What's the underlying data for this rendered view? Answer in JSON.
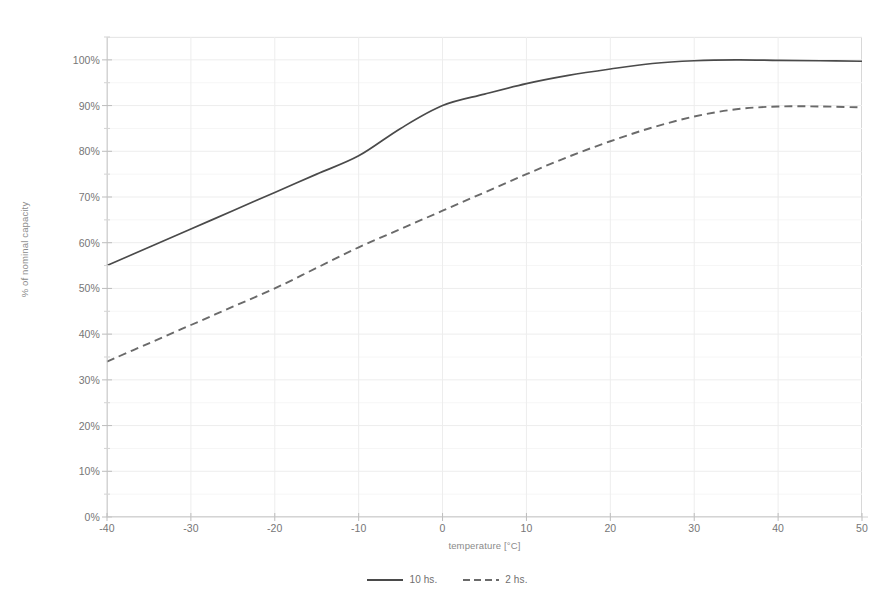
{
  "chart_data": {
    "type": "line",
    "title": "",
    "subtitle": "",
    "xlabel": "temperature [°C]",
    "ylabel": "% of nominal capacity",
    "xlim": [
      -40,
      50
    ],
    "ylim": [
      0,
      105
    ],
    "x_ticks": [
      -40,
      -30,
      -20,
      -10,
      0,
      10,
      20,
      30,
      40,
      50
    ],
    "x_tick_labels": [
      "-40",
      "-30",
      "-20",
      "-10",
      "0",
      "10",
      "20",
      "30",
      "40",
      "50"
    ],
    "y_ticks": [
      0,
      10,
      20,
      30,
      40,
      50,
      60,
      70,
      80,
      90,
      100
    ],
    "y_tick_labels": [
      "0%",
      "10%",
      "20%",
      "30%",
      "40%",
      "50%",
      "60%",
      "70%",
      "80%",
      "90%",
      "100%"
    ],
    "y_minor_ticks": [
      5,
      15,
      25,
      35,
      45,
      55,
      65,
      75,
      85,
      95,
      105
    ],
    "grid": true,
    "grid_color": "#ededed",
    "legend_position": "bottom",
    "plot_border_color": "#d8d8d8",
    "line_color": "#555555",
    "x": [
      -40,
      -35,
      -30,
      -25,
      -20,
      -15,
      -10,
      -5,
      0,
      5,
      10,
      15,
      20,
      25,
      30,
      35,
      40,
      45,
      50
    ],
    "series": [
      {
        "name": "10 hs.",
        "style": "solid",
        "color": "#4a4a4a",
        "values": [
          55.0,
          59.0,
          63.0,
          67.0,
          71.0,
          75.0,
          79.0,
          85.0,
          90.0,
          92.5,
          94.8,
          96.6,
          98.0,
          99.2,
          99.8,
          100.0,
          99.9,
          99.8,
          99.7
        ]
      },
      {
        "name": "2 hs.",
        "style": "dashed",
        "color": "#6a6a6a",
        "values": [
          34.0,
          38.0,
          42.0,
          46.0,
          50.0,
          54.5,
          59.0,
          63.0,
          67.0,
          71.0,
          75.0,
          78.8,
          82.2,
          85.2,
          87.6,
          89.2,
          89.8,
          89.8,
          89.6
        ]
      }
    ]
  },
  "legend": {
    "items": [
      {
        "label": "10 hs.",
        "style": "solid"
      },
      {
        "label": "2 hs.",
        "style": "dashed"
      }
    ]
  }
}
